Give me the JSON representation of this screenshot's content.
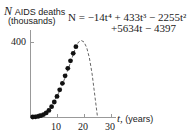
{
  "chart_data": {
    "type": "scatter",
    "title": "",
    "ylabel_var": "N",
    "ylabel": "AIDS deaths",
    "ylabel_units": "(thousands)",
    "xlabel_var": "t,",
    "xlabel": "(years)",
    "equation_line1": "N = −14t⁴ + 433t³ − 2255t²",
    "equation_line2": "+5634t − 4397",
    "x_ticks": [
      "10",
      "20",
      "30"
    ],
    "y_ticks": [
      "400"
    ],
    "xlim": [
      0,
      32
    ],
    "ylim": [
      0,
      430
    ],
    "grid": false,
    "legend": "none",
    "series": [
      {
        "name": "data points",
        "style": "filled-circles",
        "x": [
          1,
          2,
          3,
          4,
          5,
          6,
          7,
          8,
          9,
          10,
          11,
          12,
          13,
          14,
          15,
          16,
          17
        ],
        "y": [
          0.2,
          1,
          3,
          7,
          13,
          22,
          35,
          55,
          80,
          110,
          145,
          180,
          220,
          260,
          300,
          340,
          375
        ]
      },
      {
        "name": "model curve",
        "style": "dashed-line",
        "x": [
          1,
          3,
          5,
          7,
          9,
          11,
          13,
          15,
          17,
          18,
          19,
          20,
          21,
          22,
          23,
          24,
          25
        ],
        "y": [
          5,
          15,
          20,
          40,
          85,
          140,
          210,
          290,
          375,
          400,
          408,
          400,
          370,
          315,
          230,
          115,
          0
        ]
      }
    ]
  }
}
